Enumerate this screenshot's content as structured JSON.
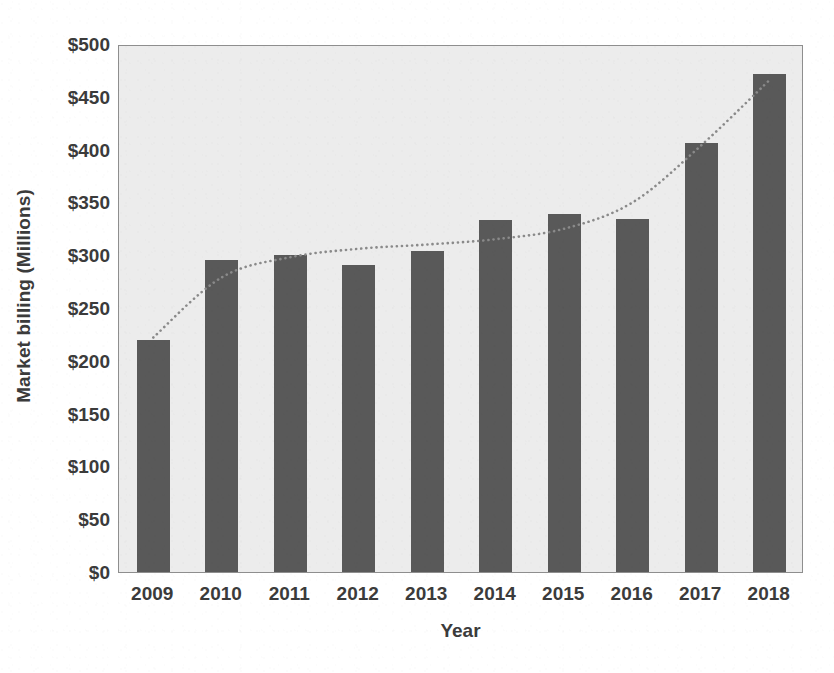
{
  "chart_data": {
    "type": "bar",
    "title": "",
    "xlabel": "Year",
    "ylabel": "Market billing (Millions)",
    "categories": [
      "2009",
      "2010",
      "2011",
      "2012",
      "2013",
      "2014",
      "2015",
      "2016",
      "2017",
      "2018"
    ],
    "values": [
      220,
      295,
      300,
      291,
      304,
      333,
      339,
      334,
      406,
      472
    ],
    "series": [
      {
        "name": "Market billing",
        "type": "bar",
        "values": [
          220,
          295,
          300,
          291,
          304,
          333,
          339,
          334,
          406,
          472
        ]
      },
      {
        "name": "Trend",
        "type": "line",
        "style": "dotted",
        "color": "#8a8a8a",
        "values": [
          224,
          281,
          300,
          308,
          312,
          317,
          327,
          352,
          406,
          468
        ]
      }
    ],
    "ylim": [
      0,
      500
    ],
    "y_tick_step": 50,
    "y_tick_labels": [
      "$500",
      "$450",
      "$400",
      "$350",
      "$300",
      "$250",
      "$200",
      "$150",
      "$100",
      "$50",
      "$0"
    ],
    "y_tick_values": [
      500,
      450,
      400,
      350,
      300,
      250,
      200,
      150,
      100,
      50,
      0
    ],
    "x_tick_labels": [
      "2009",
      "2010",
      "2011",
      "2012",
      "2013",
      "2014",
      "2015",
      "2016",
      "2017",
      "2018"
    ],
    "grid": false,
    "legend": "none",
    "value_prefix": "$",
    "colors": {
      "bar": "#595959",
      "trend": "#8a8a8a",
      "plot_background": "#ececec",
      "plot_border": "#8e8e8e",
      "text": "#3b3b3b",
      "page_background": "#ffffff"
    }
  }
}
